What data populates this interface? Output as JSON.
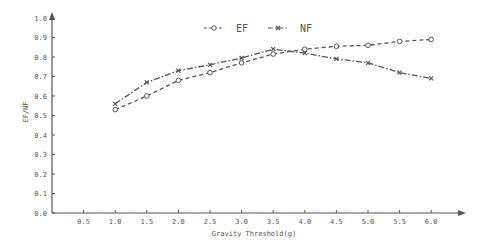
{
  "chart_data": {
    "type": "line",
    "title": "",
    "xlabel": "Gravity Threshold(g)",
    "ylabel": "EF/NF",
    "x_ticks": [
      "0.5",
      "1.0",
      "1.5",
      "2.0",
      "2.5",
      "3.0",
      "3.5",
      "4.0",
      "4.5",
      "5.0",
      "5.5",
      "6.0"
    ],
    "y_ticks": [
      "0.0",
      "0.1",
      "0.2",
      "0.3",
      "0.4",
      "0.5",
      "0.6",
      "0.7",
      "0.8",
      "0.9",
      "1.0"
    ],
    "xlim": [
      0,
      6.5
    ],
    "ylim": [
      0,
      1.0
    ],
    "grid": false,
    "legend_position": "top-center",
    "x": [
      1.0,
      1.5,
      2.0,
      2.5,
      3.0,
      3.5,
      4.0,
      4.5,
      5.0,
      5.5,
      6.0
    ],
    "series": [
      {
        "name": "EF",
        "style": "dashed-circle",
        "values": [
          0.53,
          0.6,
          0.68,
          0.72,
          0.77,
          0.815,
          0.84,
          0.855,
          0.86,
          0.88,
          0.89
        ]
      },
      {
        "name": "NF",
        "style": "dashdot-x",
        "values": [
          0.56,
          0.67,
          0.73,
          0.76,
          0.795,
          0.84,
          0.82,
          0.79,
          0.77,
          0.72,
          0.69
        ]
      }
    ],
    "colors": {
      "line": "#555555",
      "axis": "#555555"
    }
  }
}
